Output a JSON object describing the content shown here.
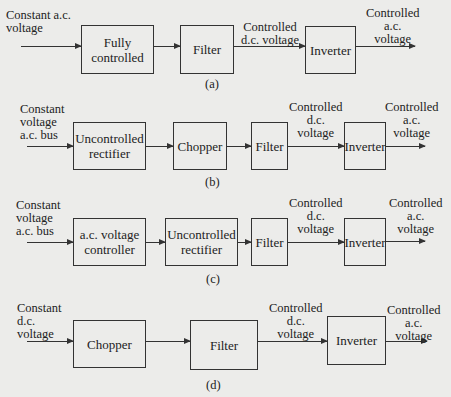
{
  "diagrams": [
    {
      "caption": "(a)",
      "input_label": "Constant a.c.\nvoltage",
      "blocks": [
        "Fully\ncontrolled",
        "Filter",
        "Inverter"
      ],
      "mid_label": "Controlled\nd.c. voltage",
      "output_label": "Controlled\na.c.\nvoltage"
    },
    {
      "caption": "(b)",
      "input_label": "Constant\nvoltage\na.c. bus",
      "blocks": [
        "Uncontrolled\nrectifier",
        "Chopper",
        "Filter",
        "Inverter"
      ],
      "mid_label": "Controlled\nd.c.\nvoltage",
      "output_label": "Controlled\na.c.\nvoltage"
    },
    {
      "caption": "(c)",
      "input_label": "Constant\nvoltage\na.c. bus",
      "blocks": [
        "a.c. voltage\ncontroller",
        "Uncontrolled\nrectifier",
        "Filter",
        "Inverter"
      ],
      "mid_label": "Controlled\nd.c.\nvoltage",
      "output_label": "Controlled\na.c.\nvoltage"
    },
    {
      "caption": "(d)",
      "input_label": "Constant\nd.c.\nvoltage",
      "blocks": [
        "Chopper",
        "Filter",
        "Inverter"
      ],
      "mid_label": "Controlled\nd.c.\nvoltage",
      "output_label": "Controlled\na.c.\nvoltage"
    }
  ]
}
